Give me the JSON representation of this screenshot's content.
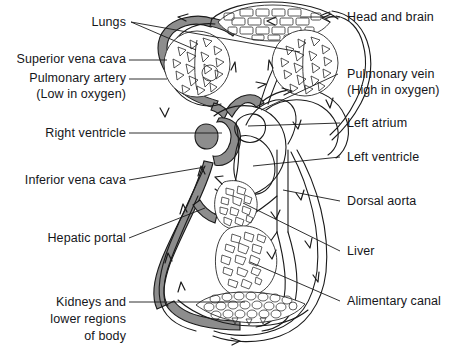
{
  "figure": {
    "type": "biological-diagram",
    "colors": {
      "deoxygenated_vessel": "#8a8a8a",
      "oxygenated_vessel": "#ffffff",
      "outline": "#1a1a1a",
      "background": "#ffffff",
      "label_text": "#15161a"
    }
  },
  "labels_left": [
    {
      "id": "lungs",
      "text": "Lungs"
    },
    {
      "id": "superior-vena-cava",
      "text": "Superior vena cava"
    },
    {
      "id": "pulmonary-artery",
      "text": "Pulmonary artery"
    },
    {
      "id": "pulmonary-artery-note",
      "text": "(Low in oxygen)"
    },
    {
      "id": "right-ventricle",
      "text": "Right ventricle"
    },
    {
      "id": "inferior-vena-cava",
      "text": "Inferior vena cava"
    },
    {
      "id": "hepatic-portal",
      "text": "Hepatic portal"
    },
    {
      "id": "kidneys-line1",
      "text": "Kidneys and"
    },
    {
      "id": "kidneys-line2",
      "text": "lower regions"
    },
    {
      "id": "kidneys-line3",
      "text": "of body"
    }
  ],
  "labels_right": [
    {
      "id": "head-and-brain",
      "text": "Head and brain"
    },
    {
      "id": "pulmonary-vein",
      "text": "Pulmonary vein"
    },
    {
      "id": "pulmonary-vein-note",
      "text": "(High in oxygen)"
    },
    {
      "id": "left-atrium",
      "text": "Left atrium"
    },
    {
      "id": "left-ventricle",
      "text": "Left ventricle"
    },
    {
      "id": "dorsal-aorta",
      "text": "Dorsal aorta"
    },
    {
      "id": "liver",
      "text": "Liver"
    },
    {
      "id": "alimentary-canal",
      "text": "Alimentary canal"
    }
  ],
  "organs": [
    {
      "id": "head-and-brain",
      "pattern": "brick"
    },
    {
      "id": "left-lung",
      "pattern": "triangular-alveoli"
    },
    {
      "id": "right-lung",
      "pattern": "triangular-alveoli"
    },
    {
      "id": "heart",
      "pattern": "chambered"
    },
    {
      "id": "liver",
      "pattern": "lobules"
    },
    {
      "id": "alimentary-canal",
      "pattern": "lobules"
    },
    {
      "id": "kidneys",
      "pattern": "rounded-cells"
    }
  ]
}
